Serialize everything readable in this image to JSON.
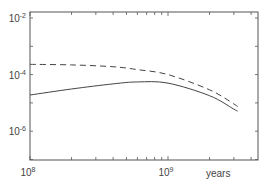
{
  "chart_data": {
    "type": "line",
    "title": "",
    "xlabel": "years",
    "ylabel": "",
    "xscale": "log",
    "yscale": "log",
    "xlim": [
      100000000.0,
      4500000000.0
    ],
    "ylim": [
      1e-07,
      0.03
    ],
    "grid": false,
    "legend": null,
    "x_tick_labels": [
      {
        "base": "10",
        "exp": "8",
        "value": 100000000.0
      },
      {
        "base": "10",
        "exp": "9",
        "value": 1000000000.0
      }
    ],
    "y_tick_labels": [
      {
        "base": "10",
        "exp": "-2",
        "value": 0.01
      },
      {
        "base": "10",
        "exp": "-4",
        "value": 0.0001
      },
      {
        "base": "10",
        "exp": "-6",
        "value": 1e-06
      }
    ],
    "series": [
      {
        "name": "dashed",
        "style": "dashed",
        "x": [
          100000000.0,
          200000000.0,
          400000000.0,
          600000000.0,
          1000000000.0,
          2000000000.0,
          3000000000.0,
          3200000000.0
        ],
        "values": [
          0.00023,
          0.00022,
          0.00019,
          0.00015,
          0.0001,
          2.9e-05,
          9.2e-06,
          7.2e-06
        ]
      },
      {
        "name": "solid",
        "style": "solid",
        "x": [
          100000000.0,
          200000000.0,
          400000000.0,
          600000000.0,
          1000000000.0,
          2000000000.0,
          3000000000.0,
          3200000000.0
        ],
        "values": [
          1.9e-05,
          3.1e-05,
          4.7e-05,
          5.5e-05,
          5e-05,
          1.8e-05,
          6e-06,
          5.1e-06
        ]
      }
    ]
  },
  "colors": {
    "axis": "#555555",
    "line": "#444444",
    "text": "#444444"
  }
}
